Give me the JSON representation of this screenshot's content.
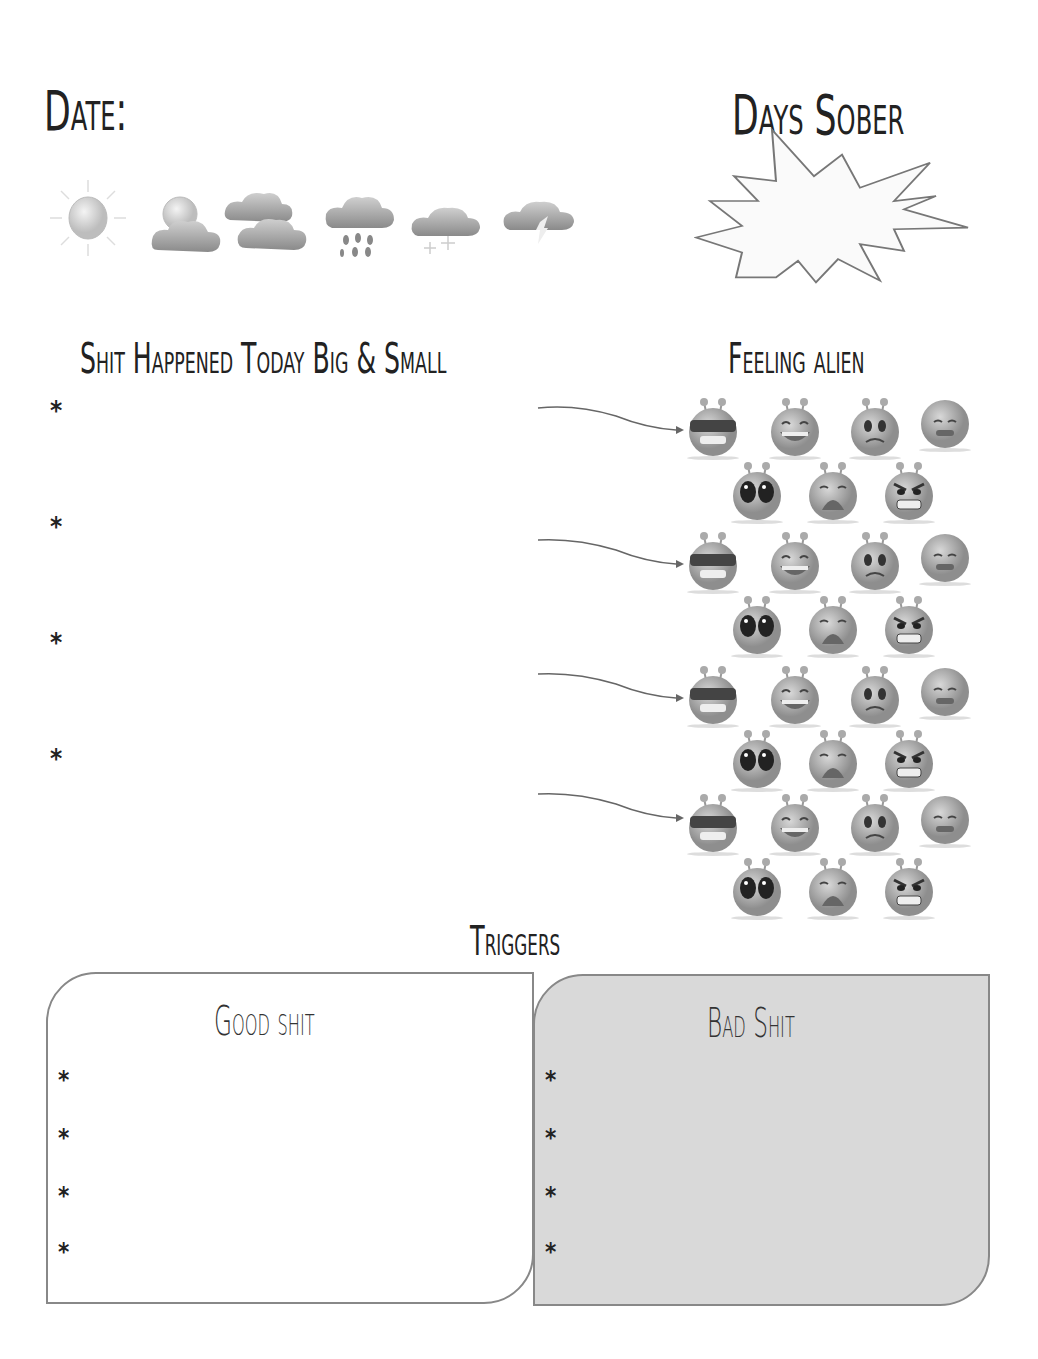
{
  "header": {
    "date_label": "Date:",
    "days_sober_label": "Days Sober"
  },
  "weather_icons": [
    "sunny-icon",
    "partly-cloudy-icon",
    "cloudy-icon",
    "rain-icon",
    "snow-icon",
    "thunderstorm-icon"
  ],
  "events_section": {
    "title": "Shit Happened Today Big & Small",
    "bullet": "*",
    "entries": [
      {
        "bullet": "*",
        "value": ""
      },
      {
        "bullet": "*",
        "value": ""
      },
      {
        "bullet": "*",
        "value": ""
      },
      {
        "bullet": "*",
        "value": ""
      }
    ]
  },
  "mood_section": {
    "title": "Feeling alien",
    "alien_faces": [
      "cool-sunglasses",
      "laughing",
      "worried",
      "sad-brain",
      "shocked",
      "crying",
      "angry"
    ]
  },
  "triggers": {
    "title": "Triggers",
    "good": {
      "title": "Good shit",
      "bullets": [
        "*",
        "*",
        "*",
        "*"
      ]
    },
    "bad": {
      "title": "Bad Shit",
      "bullets": [
        "*",
        "*",
        "*",
        "*"
      ]
    }
  },
  "colors": {
    "bad_box_fill": "#d9d9d9",
    "border": "#888888",
    "text": "#222222"
  }
}
